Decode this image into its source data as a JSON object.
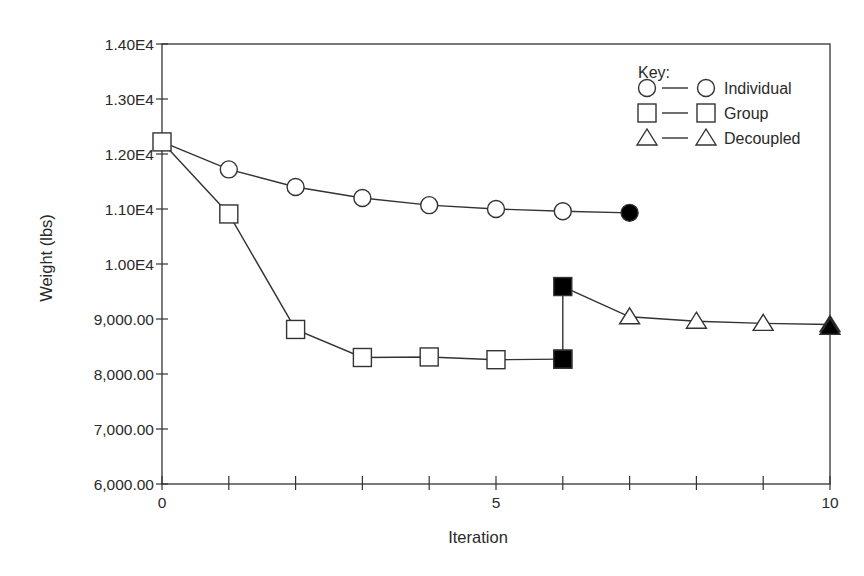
{
  "chart_data": {
    "type": "line",
    "title": "",
    "xlabel": "Iteration",
    "ylabel": "Weight (lbs)",
    "xlim": [
      0,
      10
    ],
    "ylim": [
      6000,
      14000
    ],
    "x_ticks": [
      0,
      1,
      2,
      3,
      4,
      5,
      6,
      7,
      8,
      9,
      10
    ],
    "x_tick_labels": {
      "0": "0",
      "5": "5",
      "10": "10"
    },
    "y_ticks": [
      6000,
      7000,
      8000,
      9000,
      10000,
      11000,
      12000,
      13000,
      14000
    ],
    "y_tick_labels": [
      "6,000.00",
      "7,000.00",
      "8,000.00",
      "9,000.00",
      "1.00E4",
      "1.10E4",
      "1.20E4",
      "1.30E4",
      "1.40E4"
    ],
    "grid": false,
    "legend_position": "upper right (inside)",
    "legend_title": "Key:",
    "series": [
      {
        "name": "Individual",
        "marker": "circle",
        "x": [
          0,
          1,
          2,
          3,
          4,
          5,
          6,
          7
        ],
        "values": [
          12220,
          11720,
          11400,
          11200,
          11070,
          11000,
          10960,
          10930
        ],
        "filled_points": [
          7
        ]
      },
      {
        "name": "Group",
        "marker": "square",
        "x": [
          0,
          1,
          2,
          3,
          4,
          5,
          6
        ],
        "values": [
          12220,
          10910,
          8810,
          8300,
          8310,
          8260,
          8270
        ],
        "filled_points": [
          6
        ]
      },
      {
        "name": "Decoupled",
        "marker": "triangle",
        "x": [
          6,
          6,
          7,
          8,
          9,
          10,
          10
        ],
        "values": [
          8270,
          9590,
          9040,
          8960,
          8920,
          8900,
          8850
        ],
        "start_marker": "filled square",
        "filled_points": [
          10
        ]
      }
    ]
  },
  "legend": {
    "title": "Key:",
    "items": [
      {
        "label": "Individual",
        "marker": "circle"
      },
      {
        "label": "Group",
        "marker": "square"
      },
      {
        "label": "Decoupled",
        "marker": "triangle"
      }
    ]
  },
  "colors": {
    "line": "#333333",
    "marker_fill": "#ffffff",
    "marker_filled": "#000000",
    "background": "#ffffff"
  }
}
